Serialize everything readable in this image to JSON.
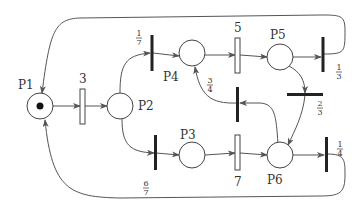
{
  "diagram": {
    "type": "petri-net",
    "places": [
      {
        "id": "P1",
        "label": "P1",
        "cx": 40,
        "cy": 106,
        "tokens": 1
      },
      {
        "id": "P2",
        "label": "P2",
        "cx": 120,
        "cy": 106,
        "tokens": 0
      },
      {
        "id": "P3",
        "label": "P3",
        "cx": 192,
        "cy": 157,
        "tokens": 0
      },
      {
        "id": "P4",
        "label": "P4",
        "cx": 192,
        "cy": 53,
        "tokens": 0
      },
      {
        "id": "P5",
        "label": "P5",
        "cx": 280,
        "cy": 57,
        "tokens": 0
      },
      {
        "id": "P6",
        "label": "P6",
        "cx": 280,
        "cy": 157,
        "tokens": 0
      }
    ],
    "transitions": [
      {
        "id": "t3",
        "label": "3",
        "kind": "timed"
      },
      {
        "id": "t5",
        "label": "5",
        "kind": "timed"
      },
      {
        "id": "t7",
        "label": "7",
        "kind": "timed"
      },
      {
        "id": "t17",
        "num": "1",
        "den": "7",
        "kind": "immediate"
      },
      {
        "id": "t67",
        "num": "6",
        "den": "7",
        "kind": "immediate"
      },
      {
        "id": "t13",
        "num": "1",
        "den": "3",
        "kind": "immediate"
      },
      {
        "id": "t23",
        "num": "2",
        "den": "3",
        "kind": "immediate"
      },
      {
        "id": "t34",
        "num": "3",
        "den": "4",
        "kind": "immediate"
      },
      {
        "id": "t14",
        "num": "1",
        "den": "4",
        "kind": "immediate"
      }
    ],
    "colors": {
      "stroke": "#444444",
      "bar": "#222222",
      "bg": "#ffffff"
    }
  }
}
